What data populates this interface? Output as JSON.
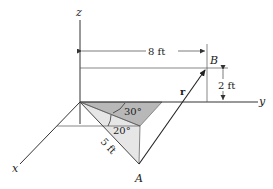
{
  "figure": {
    "axes": {
      "z_label": "z",
      "y_label": "y",
      "x_label": "x"
    },
    "points": {
      "A_label": "A",
      "B_label": "B"
    },
    "vector": {
      "label": "r"
    },
    "dimensions": {
      "horizontal": "8 ft",
      "vertical": "2 ft",
      "slant": "5 ft"
    },
    "angles": {
      "upper": "30°",
      "lower": "20°"
    },
    "colors": {
      "dark_face": "#b8b8b8",
      "light_face": "#e6e6e6",
      "line": "#333333"
    }
  }
}
